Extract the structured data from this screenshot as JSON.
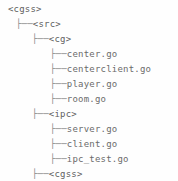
{
  "view": {
    "kind": "directory-tree",
    "background_color": "#fefefe",
    "text_color": "#6b6b6b",
    "branch_color": "#8a8a8a",
    "line_height_px": 15,
    "font_size_px": 9
  },
  "glyphs": {
    "branch_tee": "├──",
    "indent_unit": "   "
  },
  "tree": {
    "root_label": "<cgss>",
    "nodes": [
      {
        "id": "root",
        "label": "<cgss>",
        "type": "dir",
        "depth": 0,
        "has_branch": false,
        "top": 2,
        "left": 8
      },
      {
        "id": "src",
        "label": "<src>",
        "type": "dir",
        "depth": 1,
        "has_branch": true,
        "top": 17,
        "left": 16
      },
      {
        "id": "cg",
        "label": "<cg>",
        "type": "dir",
        "depth": 2,
        "has_branch": true,
        "top": 32,
        "left": 32
      },
      {
        "id": "center",
        "label": "center.go",
        "type": "file",
        "depth": 3,
        "has_branch": true,
        "top": 47,
        "left": 50
      },
      {
        "id": "centerclient",
        "label": "centerclient.go",
        "type": "file",
        "depth": 3,
        "has_branch": true,
        "top": 62,
        "left": 50
      },
      {
        "id": "player",
        "label": "player.go",
        "type": "file",
        "depth": 3,
        "has_branch": true,
        "top": 77,
        "left": 50
      },
      {
        "id": "room",
        "label": "room.go",
        "type": "file",
        "depth": 3,
        "has_branch": true,
        "top": 92,
        "left": 50
      },
      {
        "id": "ipc",
        "label": "<ipc>",
        "type": "dir",
        "depth": 2,
        "has_branch": true,
        "top": 107,
        "left": 32
      },
      {
        "id": "server",
        "label": "server.go",
        "type": "file",
        "depth": 3,
        "has_branch": true,
        "top": 122,
        "left": 50
      },
      {
        "id": "client",
        "label": "client.go",
        "type": "file",
        "depth": 3,
        "has_branch": true,
        "top": 137,
        "left": 50
      },
      {
        "id": "ipc_test",
        "label": "ipc_test.go",
        "type": "file",
        "depth": 3,
        "has_branch": true,
        "top": 152,
        "left": 50
      },
      {
        "id": "cgss_dir",
        "label": "<cgss>",
        "type": "dir",
        "depth": 2,
        "has_branch": true,
        "top": 152,
        "left": 32
      },
      {
        "id": "cgss_go",
        "label": "cgss.go",
        "type": "file",
        "depth": 3,
        "has_branch": true,
        "top": 167,
        "left": 50
      }
    ]
  },
  "lines": [
    {
      "indent_px": 8,
      "branch": "",
      "label": "<cgss>",
      "type": "dir",
      "name": "tree-node-cgss-root"
    },
    {
      "indent_px": 16,
      "branch": "├──",
      "label": "<src>",
      "type": "dir",
      "name": "tree-node-src"
    },
    {
      "indent_px": 32,
      "branch": "├──",
      "label": "<cg>",
      "type": "dir",
      "name": "tree-node-cg"
    },
    {
      "indent_px": 50,
      "branch": "├──",
      "label": "center.go",
      "type": "file",
      "name": "tree-node-center-go"
    },
    {
      "indent_px": 50,
      "branch": "├──",
      "label": "centerclient.go",
      "type": "file",
      "name": "tree-node-centerclient-go"
    },
    {
      "indent_px": 50,
      "branch": "├──",
      "label": "player.go",
      "type": "file",
      "name": "tree-node-player-go"
    },
    {
      "indent_px": 50,
      "branch": "├──",
      "label": "room.go",
      "type": "file",
      "name": "tree-node-room-go"
    },
    {
      "indent_px": 32,
      "branch": "├──",
      "label": "<ipc>",
      "type": "dir",
      "name": "tree-node-ipc"
    },
    {
      "indent_px": 50,
      "branch": "├──",
      "label": "server.go",
      "type": "file",
      "name": "tree-node-server-go"
    },
    {
      "indent_px": 50,
      "branch": "├──",
      "label": "client.go",
      "type": "file",
      "name": "tree-node-client-go"
    },
    {
      "indent_px": 50,
      "branch": "├──",
      "label": "ipc_test.go",
      "type": "file",
      "name": "tree-node-ipc-test-go"
    },
    {
      "indent_px": 32,
      "branch": "├──",
      "label": "<cgss>",
      "type": "dir",
      "name": "tree-node-cgss-dir"
    },
    {
      "indent_px": 50,
      "branch": "├──",
      "label": "cgss.go",
      "type": "file",
      "name": "tree-node-cgss-go"
    }
  ]
}
